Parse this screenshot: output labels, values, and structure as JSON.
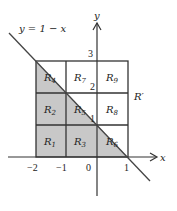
{
  "diagram": {
    "type": "coordinate-plane region partition",
    "line_label": "y = 1 − x",
    "line_equation": "y = 1 - x",
    "axis_labels": {
      "x": "x",
      "y": "y"
    },
    "x_ticks": [
      "−2",
      "−1",
      "0",
      "1"
    ],
    "y_ticks": [
      "1",
      "2",
      "3"
    ],
    "region_label": "R′",
    "regions": [
      {
        "name": "R",
        "sub": "1",
        "col": 0,
        "row": 0,
        "shading": "full"
      },
      {
        "name": "R",
        "sub": "2",
        "col": 0,
        "row": 1,
        "shading": "full"
      },
      {
        "name": "R",
        "sub": "4",
        "col": 0,
        "row": 2,
        "shading": "lower-triangle"
      },
      {
        "name": "R",
        "sub": "3",
        "col": 1,
        "row": 0,
        "shading": "full"
      },
      {
        "name": "R",
        "sub": "5",
        "col": 1,
        "row": 1,
        "shading": "lower-triangle"
      },
      {
        "name": "R",
        "sub": "7",
        "col": 1,
        "row": 2,
        "shading": "none"
      },
      {
        "name": "R",
        "sub": "6",
        "col": 2,
        "row": 0,
        "shading": "lower-triangle"
      },
      {
        "name": "R",
        "sub": "8",
        "col": 2,
        "row": 1,
        "shading": "none"
      },
      {
        "name": "R",
        "sub": "9",
        "col": 2,
        "row": 2,
        "shading": "none"
      }
    ],
    "grid": {
      "x_range": [
        -2,
        1
      ],
      "y_range": [
        0,
        3
      ]
    },
    "colors": {
      "shade": "#c8c8c8",
      "line": "#333333",
      "background": "#ffffff"
    }
  }
}
